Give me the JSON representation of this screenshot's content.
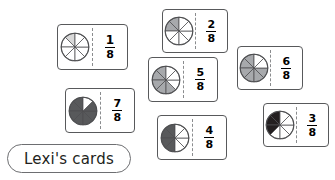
{
  "worksheet": {
    "label_pill": {
      "text": "Lexi's cards"
    },
    "denominator_common": "8",
    "segments_per_circle": 8,
    "colors": {
      "card_border": "#58595b",
      "divider": "#8a8c8e",
      "pill_border": "#6d6e71",
      "text": "#231f20",
      "shade_light": "#d9d9d9",
      "shade_medium": "#a7a9ac",
      "shade_dark": "#58595b",
      "shade_darkest": "#231f20",
      "unshaded": "#ffffff",
      "background": "#ffffff"
    },
    "cards": [
      {
        "id": "card-1-8",
        "numerator": "1",
        "denominator": "8",
        "fraction_text": "1/8",
        "shaded_segments": 1,
        "shade_color": "#d9d9d9",
        "x": 57,
        "y": 24,
        "w": 71,
        "h": 46
      },
      {
        "id": "card-2-8",
        "numerator": "2",
        "denominator": "8",
        "fraction_text": "2/8",
        "shaded_segments": 2,
        "shade_color": "#a7a9ac",
        "x": 162,
        "y": 9,
        "w": 66,
        "h": 44
      },
      {
        "id": "card-5-8",
        "numerator": "5",
        "denominator": "8",
        "fraction_text": "5/8",
        "shaded_segments": 5,
        "shade_color": "#a7a9ac",
        "x": 148,
        "y": 57,
        "w": 70,
        "h": 45
      },
      {
        "id": "card-6-8",
        "numerator": "6",
        "denominator": "8",
        "fraction_text": "6/8",
        "shaded_segments": 6,
        "shade_color": "#a7a9ac",
        "x": 237,
        "y": 46,
        "w": 66,
        "h": 44
      },
      {
        "id": "card-7-8",
        "numerator": "7",
        "denominator": "8",
        "fraction_text": "7/8",
        "shaded_segments": 7,
        "shade_color": "#58595b",
        "x": 65,
        "y": 88,
        "w": 70,
        "h": 45
      },
      {
        "id": "card-4-8",
        "numerator": "4",
        "denominator": "8",
        "fraction_text": "4/8",
        "shaded_segments": 4,
        "shade_color": "#58595b",
        "x": 157,
        "y": 115,
        "w": 70,
        "h": 45
      },
      {
        "id": "card-3-8",
        "numerator": "3",
        "denominator": "8",
        "fraction_text": "3/8",
        "shaded_segments": 3,
        "shade_color": "#231f20",
        "x": 263,
        "y": 103,
        "w": 66,
        "h": 44
      }
    ],
    "pill": {
      "x": 7,
      "y": 144,
      "w": 124,
      "h": 29
    }
  }
}
